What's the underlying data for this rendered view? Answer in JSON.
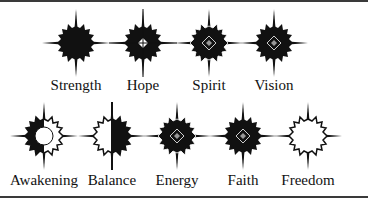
{
  "rows": [
    {
      "items": [
        {
          "name": "Strength",
          "style": "solid",
          "cx": 76,
          "cy": 43
        },
        {
          "name": "Hope",
          "style": "solid-hollow-center",
          "cx": 143,
          "cy": 43
        },
        {
          "name": "Spirit",
          "style": "outlined-rays-diamond",
          "cx": 209,
          "cy": 43
        },
        {
          "name": "Vision",
          "style": "solid-diamond",
          "cx": 274,
          "cy": 43
        }
      ]
    },
    {
      "items": [
        {
          "name": "Awakening",
          "style": "half-outline-sun-circle",
          "cx": 44,
          "cy": 136
        },
        {
          "name": "Balance",
          "style": "half-outline-half-solid",
          "cx": 112,
          "cy": 136
        },
        {
          "name": "Energy",
          "style": "outlined-rays-diamond",
          "cx": 177,
          "cy": 136
        },
        {
          "name": "Faith",
          "style": "solid-diamond",
          "cx": 243,
          "cy": 136
        },
        {
          "name": "Freedom",
          "style": "outline",
          "cx": 308,
          "cy": 136
        }
      ]
    }
  ],
  "labels": {
    "strength": "Strength",
    "hope": "Hope",
    "spirit": "Spirit",
    "vision": "Vision",
    "awakening": "Awakening",
    "balance": "Balance",
    "energy": "Energy",
    "faith": "Faith",
    "freedom": "Freedom"
  },
  "colors": {
    "ink": "#111111",
    "frame": "#3a3a3a",
    "background": "#ffffff"
  }
}
